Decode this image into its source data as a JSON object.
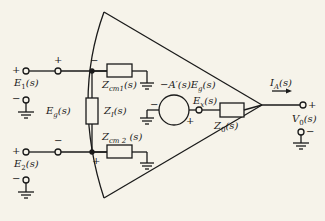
{
  "diagram": {
    "type": "circuit",
    "colors": {
      "background": "#f6f3ea",
      "ink": "#1a1a1a"
    },
    "inputs": {
      "e1": {
        "label": "E₁(s)",
        "pos_sign": "+",
        "neg_sign": "−",
        "node_sign": "+"
      },
      "e2": {
        "label": "E₂(s)",
        "pos_sign": "+",
        "neg_sign": "−",
        "node_sign": "−"
      },
      "eg": {
        "label": "E_g(s)"
      }
    },
    "components": {
      "zcm1": {
        "label": "Z_cm1(s)"
      },
      "zcm2": {
        "label": "Z_cm2(s)"
      },
      "zi": {
        "label": "Z_I(s)"
      },
      "z0": {
        "label": "Z₀(s)"
      },
      "source": {
        "label": "−A′(s)E_g(s)",
        "neg_sign": "−",
        "pos_sign": "+"
      },
      "ex": {
        "label": "E_x(s)"
      }
    },
    "internal_signs": {
      "top_node": "−",
      "bottom_node": "+"
    },
    "output": {
      "current": "I_A(s)",
      "voltage": "V₀(s)",
      "pos_sign": "+",
      "neg_sign": "−"
    }
  }
}
